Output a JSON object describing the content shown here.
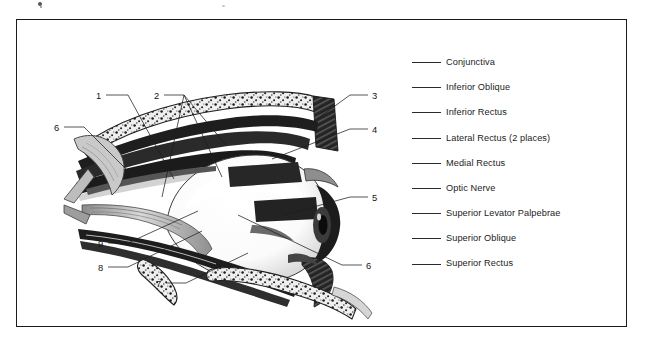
{
  "figure": {
    "background_color": "#ffffff",
    "frame_color": "#1b1b1b",
    "ink_color": "#1d1d1d"
  },
  "legend": {
    "items": [
      {
        "number": "",
        "label": "Conjunctiva"
      },
      {
        "number": "",
        "label": "Inferior Oblique"
      },
      {
        "number": "",
        "label": "Inferior Rectus"
      },
      {
        "number": "",
        "label": "Lateral Rectus (2 places)"
      },
      {
        "number": "",
        "label": "Medial Rectus"
      },
      {
        "number": "",
        "label": "Optic Nerve"
      },
      {
        "number": "",
        "label": "Superior Levator Palpebrae"
      },
      {
        "number": "",
        "label": "Superior Oblique"
      },
      {
        "number": "",
        "label": "Superior Rectus"
      }
    ]
  },
  "callouts": [
    {
      "id": "1",
      "number": "1"
    },
    {
      "id": "2",
      "number": "2"
    },
    {
      "id": "3",
      "number": "3"
    },
    {
      "id": "4",
      "number": "4"
    },
    {
      "id": "5",
      "number": "5"
    },
    {
      "id": "6-left",
      "number": "6"
    },
    {
      "id": "6-right",
      "number": "6"
    },
    {
      "id": "7",
      "number": "7"
    },
    {
      "id": "8",
      "number": "8"
    },
    {
      "id": "9",
      "number": "9"
    }
  ]
}
